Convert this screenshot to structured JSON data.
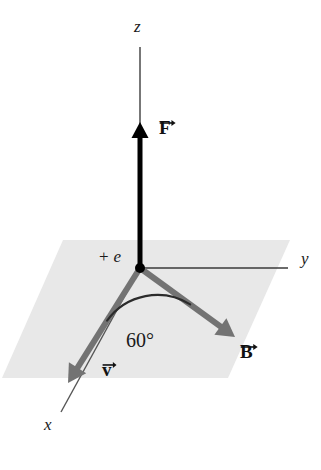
{
  "figure": {
    "background_color": "#ffffff",
    "width": 321,
    "height": 470
  },
  "plane": {
    "name": "xy-plane",
    "fill_color": "#e8e8e8",
    "corners": [
      [
        63,
        240
      ],
      [
        290,
        240
      ],
      [
        228,
        378
      ],
      [
        2,
        378
      ]
    ]
  },
  "axes": [
    {
      "id": "z",
      "label": "z",
      "label_pos": [
        134,
        26
      ],
      "color": "#555555",
      "from": [
        140,
        47
      ],
      "to": [
        140,
        268
      ]
    },
    {
      "id": "y",
      "label": "y",
      "label_pos": [
        301,
        259
      ],
      "color": "#3a3a3a",
      "from": [
        140,
        268
      ],
      "to": [
        288,
        268
      ]
    },
    {
      "id": "x",
      "label": "x",
      "label_pos": [
        44,
        425
      ],
      "color": "#555555",
      "from": [
        140,
        268
      ],
      "to": [
        61,
        412
      ]
    }
  ],
  "origin": {
    "label_sign": "+",
    "label_symbol": "e",
    "label_pos": [
      98,
      255
    ],
    "point": [
      140,
      268
    ],
    "dot_color": "#000000",
    "dot_radius": 5
  },
  "vectors": [
    {
      "id": "F",
      "label": "F",
      "label_pos": [
        158,
        116
      ],
      "color": "#000000",
      "from": [
        140,
        268
      ],
      "to": [
        140,
        122
      ],
      "width": 5,
      "description": "magnetic force, along +z"
    },
    {
      "id": "B",
      "label": "B",
      "label_pos": [
        240,
        340
      ],
      "color": "#737373",
      "from": [
        140,
        268
      ],
      "to": [
        235,
        337
      ],
      "width": 6,
      "description": "magnetic field, in xy-plane"
    },
    {
      "id": "v",
      "label": "v",
      "label_pos": [
        101,
        358
      ],
      "color": "#737373",
      "from": [
        140,
        268
      ],
      "to": [
        68,
        383
      ],
      "width": 6,
      "description": "velocity, in xy-plane toward +x"
    }
  ],
  "angle": {
    "value": "60°",
    "label_pos": [
      126,
      330
    ],
    "between": [
      "v",
      "B"
    ],
    "arc_color": "#2b2b2b",
    "arc_radius": 62
  }
}
